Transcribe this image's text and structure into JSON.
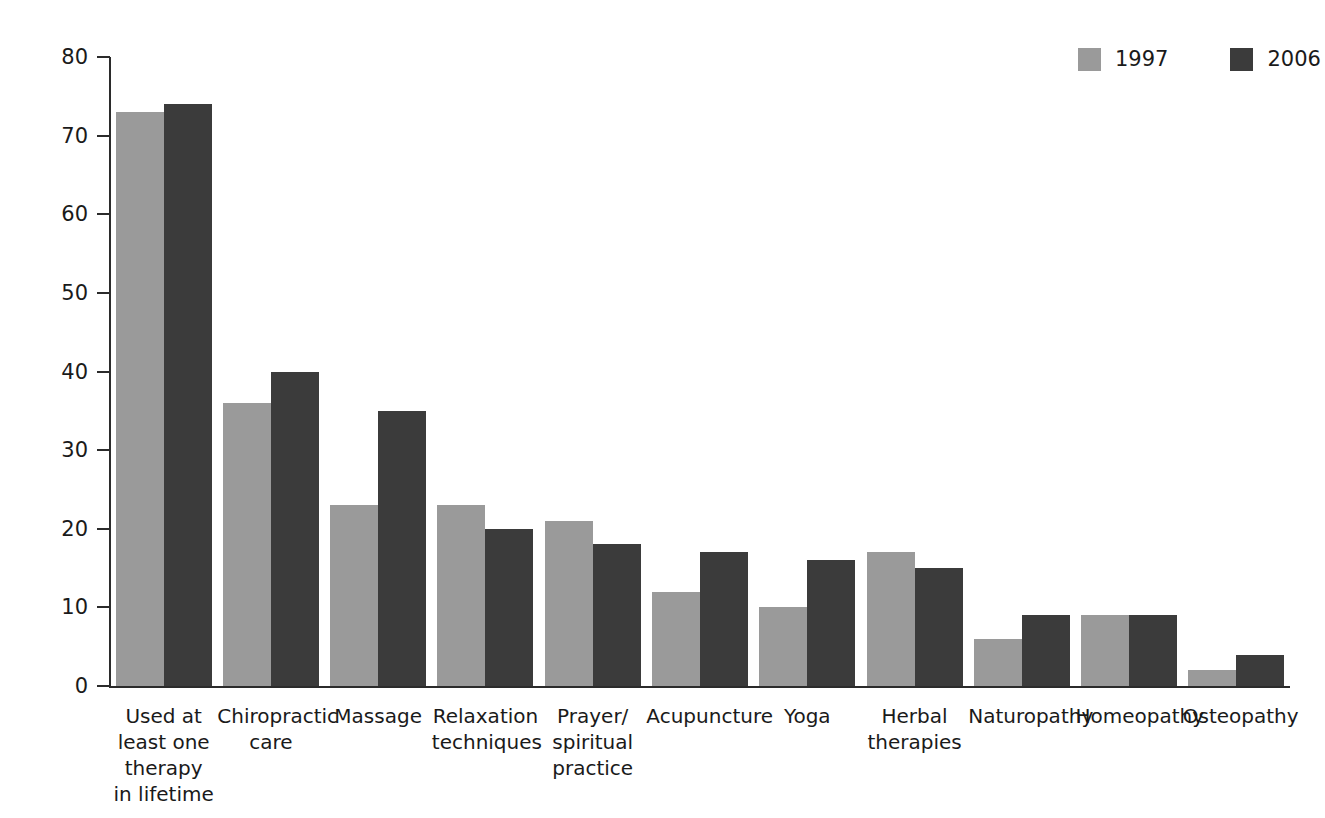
{
  "chart_data": {
    "type": "bar",
    "title": "",
    "subtitle": "",
    "xlabel": "",
    "ylabel": "Per cent",
    "ylim": [
      0,
      80
    ],
    "yticks": [
      0,
      10,
      20,
      30,
      40,
      50,
      60,
      70,
      80
    ],
    "grid": false,
    "legend_position": "top-right",
    "categories": [
      "Used at\nleast one\ntherapy\nin lifetime",
      "Chiropractic\ncare",
      "Massage",
      "Relaxation\ntechniques",
      "Prayer/\nspiritual\npractice",
      "Acupuncture",
      "Yoga",
      "Herbal\ntherapies",
      "Naturopathy",
      "Homeopathy",
      "Osteopathy"
    ],
    "series": [
      {
        "name": "1997",
        "color": "#9a9a9a",
        "values": [
          73,
          36,
          23,
          23,
          21,
          12,
          10,
          17,
          6,
          9,
          2
        ]
      },
      {
        "name": "2006",
        "color": "#3b3b3b",
        "values": [
          74,
          40,
          35,
          20,
          18,
          17,
          16,
          15,
          9,
          9,
          4
        ]
      }
    ]
  },
  "legend": {
    "items": [
      {
        "label": "1997",
        "color": "#9a9a9a"
      },
      {
        "label": "2006",
        "color": "#3b3b3b"
      }
    ]
  },
  "axes": {
    "y_title": "Per cent",
    "y_tick_labels": [
      "0",
      "10",
      "20",
      "30",
      "40",
      "50",
      "60",
      "70",
      "80"
    ]
  }
}
